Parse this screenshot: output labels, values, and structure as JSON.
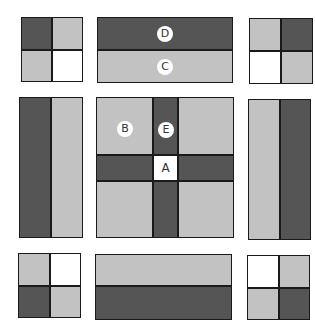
{
  "diagram": {
    "type": "quilt-block-assembly",
    "layout": "3x3 exploded grid",
    "colors": {
      "dark": "#555555",
      "light": "#c2c2c2",
      "white": "#ffffff",
      "border": "#1a1a1a"
    },
    "labels": {
      "A": "A",
      "B": "B",
      "C": "C",
      "D": "D",
      "E": "E"
    },
    "blocks": [
      {
        "id": "top-left",
        "kind": "four-patch",
        "cells": [
          "dark",
          "light",
          "light",
          "white"
        ]
      },
      {
        "id": "top-middle",
        "kind": "two-strip-horizontal",
        "cells": [
          "dark",
          "light"
        ],
        "labels": [
          "D",
          "C"
        ]
      },
      {
        "id": "top-right",
        "kind": "four-patch",
        "cells": [
          "light",
          "dark",
          "white",
          "light"
        ]
      },
      {
        "id": "middle-left",
        "kind": "two-strip-vertical",
        "cells": [
          "dark",
          "light"
        ]
      },
      {
        "id": "center",
        "kind": "cross-block",
        "corners": "light",
        "sashing": "dark",
        "center_square": "white",
        "labels": [
          "B",
          "E",
          "A"
        ]
      },
      {
        "id": "middle-right",
        "kind": "two-strip-vertical",
        "cells": [
          "light",
          "dark"
        ]
      },
      {
        "id": "bottom-left",
        "kind": "four-patch",
        "cells": [
          "light",
          "white",
          "dark",
          "light"
        ]
      },
      {
        "id": "bottom-middle",
        "kind": "two-strip-horizontal",
        "cells": [
          "light",
          "dark"
        ]
      },
      {
        "id": "bottom-right",
        "kind": "four-patch",
        "cells": [
          "white",
          "light",
          "light",
          "dark"
        ]
      }
    ]
  }
}
